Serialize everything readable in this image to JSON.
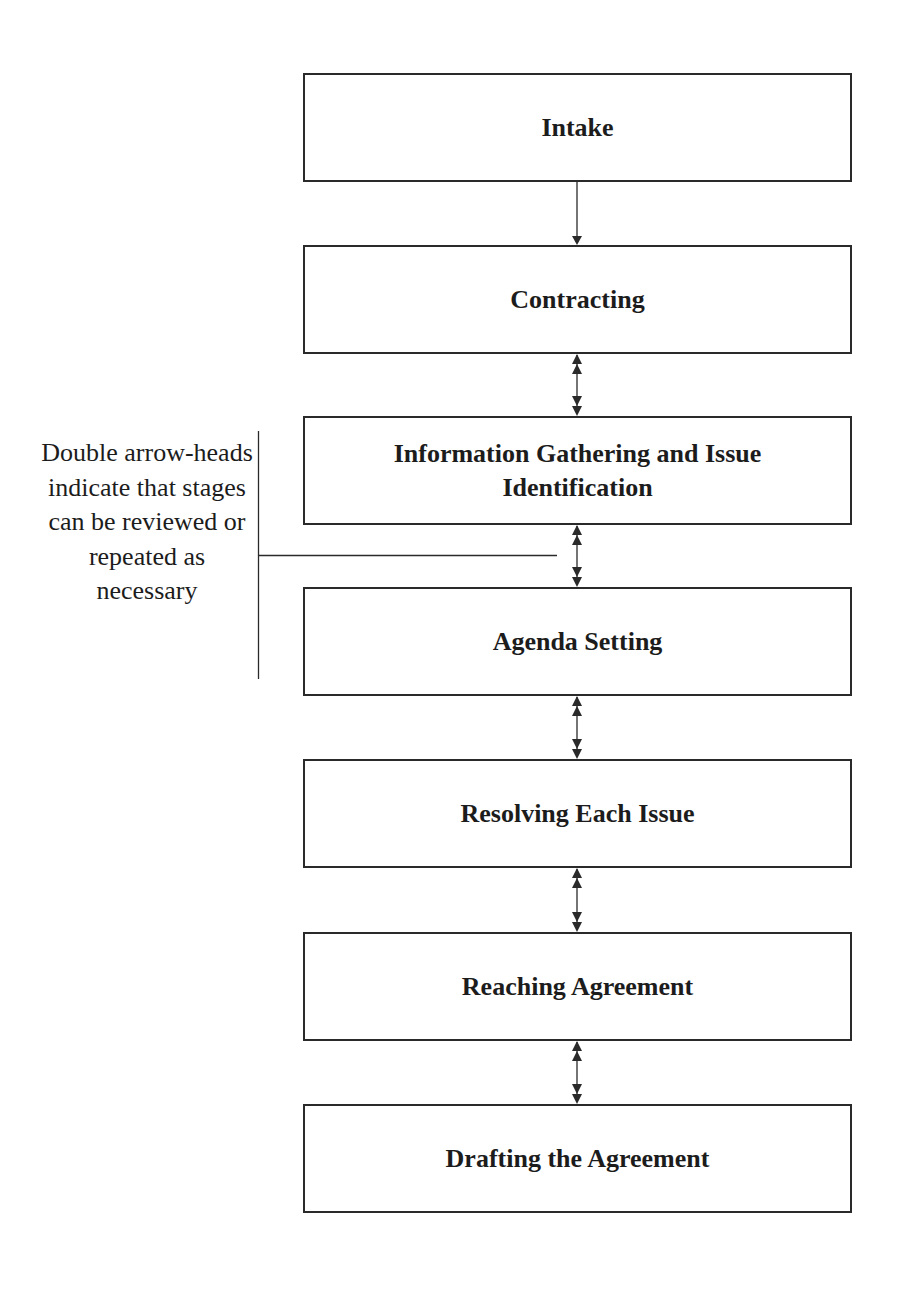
{
  "diagram": {
    "type": "flowchart",
    "stages": [
      {
        "label": "Intake"
      },
      {
        "label": "Contracting"
      },
      {
        "label": "Information Gathering and Issue Identification"
      },
      {
        "label": "Agenda Setting"
      },
      {
        "label": "Resolving Each Issue"
      },
      {
        "label": "Reaching Agreement"
      },
      {
        "label": "Drafting the Agreement"
      }
    ],
    "connectors": [
      {
        "from": "Intake",
        "to": "Contracting",
        "style": "single-arrow"
      },
      {
        "from": "Contracting",
        "to": "Information Gathering and Issue Identification",
        "style": "double-arrowheads"
      },
      {
        "from": "Information Gathering and Issue Identification",
        "to": "Agenda Setting",
        "style": "double-arrowheads"
      },
      {
        "from": "Agenda Setting",
        "to": "Resolving Each Issue",
        "style": "double-arrowheads"
      },
      {
        "from": "Resolving Each Issue",
        "to": "Reaching Agreement",
        "style": "double-arrowheads"
      },
      {
        "from": "Reaching Agreement",
        "to": "Drafting the Agreement",
        "style": "double-arrowheads"
      }
    ],
    "note": "Double arrow-heads indicate that stages can be reviewed or repeated as necessary"
  },
  "colors": {
    "line": "#2a2a2a",
    "text": "#1c1c1c",
    "background": "#ffffff"
  }
}
